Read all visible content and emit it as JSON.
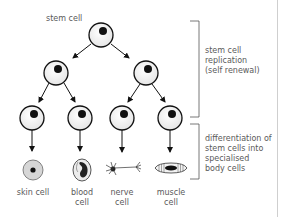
{
  "diagram": {
    "top_label": "stem cell",
    "bracket_top_label": [
      "stem cell",
      "replication",
      "(self renewal)"
    ],
    "bracket_bottom_label": [
      "differentiation of",
      "stem cells into",
      "specialised",
      "body cells"
    ],
    "cell_types": [
      {
        "name": "skin-cell",
        "label": [
          "skin cell"
        ]
      },
      {
        "name": "blood-cell",
        "label": [
          "blood",
          "cell"
        ]
      },
      {
        "name": "nerve-cell",
        "label": [
          "nerve",
          "cell"
        ]
      },
      {
        "name": "muscle-cell",
        "label": [
          "muscle",
          "cell"
        ]
      }
    ]
  }
}
